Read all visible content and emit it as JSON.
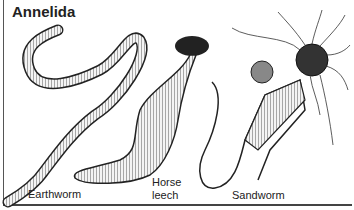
{
  "figure": {
    "title": "Annelida",
    "labels": {
      "earthworm": "Earthworm",
      "horse_leech_line1": "Horse",
      "horse_leech_line2": "leech",
      "sandworm": "Sandworm"
    }
  }
}
